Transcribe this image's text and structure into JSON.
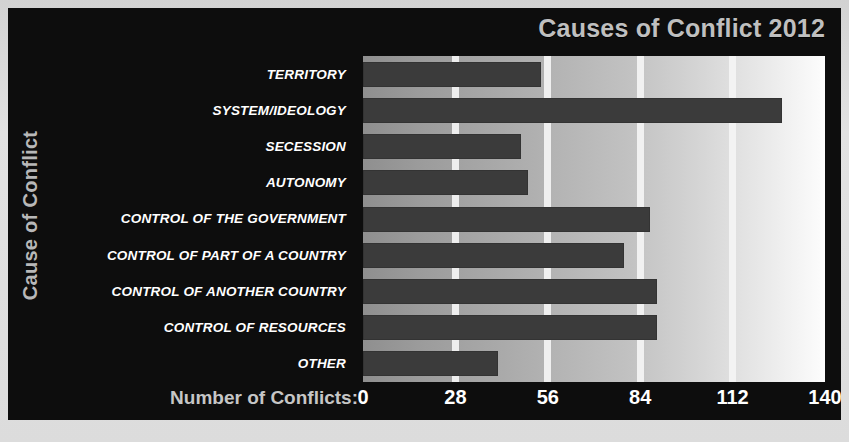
{
  "chart_data": {
    "type": "bar",
    "orientation": "horizontal",
    "title": "Causes of Conflict 2012",
    "xlabel": "Number of Conflicts:",
    "ylabel": "Cause of Conflict",
    "categories": [
      "TERRITORY",
      "SYSTEM/IDEOLOGY",
      "SECESSION",
      "AUTONOMY",
      "CONTROL OF THE GOVERNMENT",
      "CONTROL OF PART OF A COUNTRY",
      "CONTROL OF ANOTHER COUNTRY",
      "CONTROL OF RESOURCES",
      "OTHER"
    ],
    "values": [
      54,
      127,
      48,
      50,
      87,
      79,
      89,
      89,
      41
    ],
    "xticks": [
      "0",
      "28",
      "56",
      "84",
      "112",
      "140"
    ],
    "xtick_values": [
      0,
      28,
      56,
      84,
      112,
      140
    ],
    "xlim": [
      0,
      140
    ],
    "grid": true,
    "gridlines_at": [
      28,
      56,
      84,
      112
    ],
    "legend": "none",
    "colors": {
      "bar": "#3b3b3b",
      "panel_background": "#0d0d0d",
      "plot_gradient_start": "#8f8f8f",
      "plot_gradient_end": "#fdfdfd",
      "gridline": "#f4f4f4",
      "title_text": "#bfbfbf",
      "label_text": "#ffffff"
    }
  },
  "caption": ""
}
